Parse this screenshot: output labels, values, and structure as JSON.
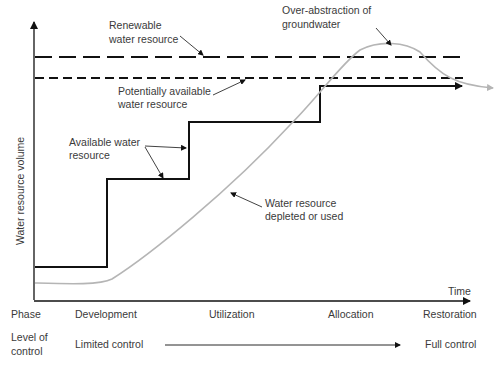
{
  "diagram": {
    "y_axis_label": "Water resource volume",
    "x_axis_label": "Time",
    "annotations": {
      "renewable": [
        "Renewable",
        "water resource"
      ],
      "potentially_available": [
        "Potentially available",
        "water resource"
      ],
      "over_abstraction": [
        "Over-abstraction of",
        "groundwater"
      ],
      "available": [
        "Available water",
        "resource"
      ],
      "depleted": [
        "Water resource",
        "depleted or used"
      ]
    },
    "phase_row": {
      "label": "Phase",
      "phases": [
        "Development",
        "Utilization",
        "Allocation",
        "Restoration"
      ]
    },
    "control_row": {
      "label": [
        "Level of",
        "control"
      ],
      "start": "Limited control",
      "end": "Full control"
    },
    "colors": {
      "line": "#111111",
      "curve": "#b5b5b5",
      "text": "#3a3a3a"
    }
  }
}
